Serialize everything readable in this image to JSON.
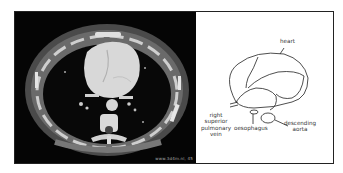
{
  "figure": {
    "ct_image": {
      "description": "axial contrast-enhanced CT of the chest at heart level",
      "watermark": "www.3d4m.nl, 45"
    },
    "diagram": {
      "labels": {
        "heart": "heart",
        "right_superior_pulmonary_vein": [
          "right",
          "superior",
          "pulmonary",
          "vein"
        ],
        "oesophagus": "oesophagus",
        "descending_aorta": [
          "descending",
          "aorta"
        ]
      }
    }
  }
}
